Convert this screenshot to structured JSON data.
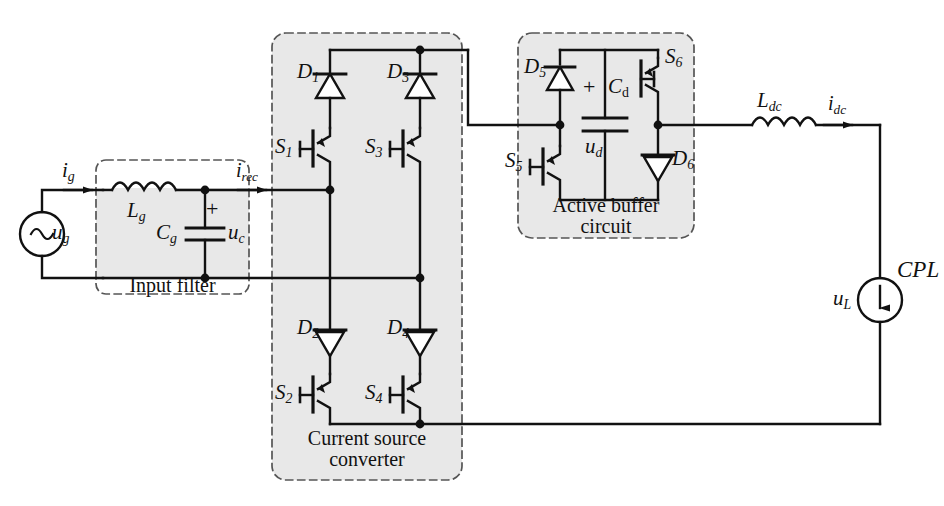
{
  "diagram": {
    "colors": {
      "line": "#111111",
      "shade_fill": "#e8e8e8",
      "dash_stroke": "#555555",
      "background": "#ffffff"
    }
  },
  "blocks": {
    "input_filter": {
      "label": "Input filter"
    },
    "converter": {
      "label_line1": "Current source",
      "label_line2": "converter"
    },
    "buffer": {
      "label_line1": "Active buffer",
      "label_line2": "circuit"
    }
  },
  "labels": {
    "ug": {
      "base": "u",
      "sub": "g"
    },
    "ig": {
      "base": "i",
      "sub": "g"
    },
    "Lg": {
      "base": "L",
      "sub": "g"
    },
    "Cg": {
      "base": "C",
      "sub": "g"
    },
    "uc": {
      "base": "u",
      "sub": "c"
    },
    "plus_cg": "+",
    "irec": {
      "base": "i",
      "sub": "rec"
    },
    "S1": {
      "base": "S",
      "sub": "1"
    },
    "S2": {
      "base": "S",
      "sub": "2"
    },
    "S3": {
      "base": "S",
      "sub": "3"
    },
    "S4": {
      "base": "S",
      "sub": "4"
    },
    "S5": {
      "base": "S",
      "sub": "5"
    },
    "S6": {
      "base": "S",
      "sub": "6"
    },
    "D1": {
      "base": "D",
      "sub": "1"
    },
    "D2": {
      "base": "D",
      "sub": "2"
    },
    "D3": {
      "base": "D",
      "sub": "3"
    },
    "D4": {
      "base": "D",
      "sub": "4"
    },
    "D5": {
      "base": "D",
      "sub": "5"
    },
    "D6": {
      "base": "D",
      "sub": "6"
    },
    "Cd": {
      "base": "C",
      "sub": "d"
    },
    "ud": {
      "base": "u",
      "sub": "d"
    },
    "plus_cd": "+",
    "Ldc": {
      "base": "L",
      "sub": "dc"
    },
    "idc": {
      "base": "i",
      "sub": "dc"
    },
    "uL": {
      "base": "u",
      "sub": "L"
    },
    "CPL": "CPL"
  }
}
